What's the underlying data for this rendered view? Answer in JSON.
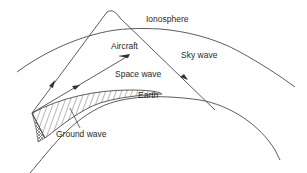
{
  "diagram": {
    "type": "radio-wave-propagation",
    "labels": {
      "ionosphere": "Ionosphere",
      "aircraft": "Aircraft",
      "sky_wave": "Sky wave",
      "space_wave": "Space wave",
      "earth": "Earth",
      "ground_wave": "Ground wave"
    },
    "colors": {
      "line": "#4a4a4a",
      "text": "#2a2a2a",
      "background": "#ffffff"
    }
  }
}
